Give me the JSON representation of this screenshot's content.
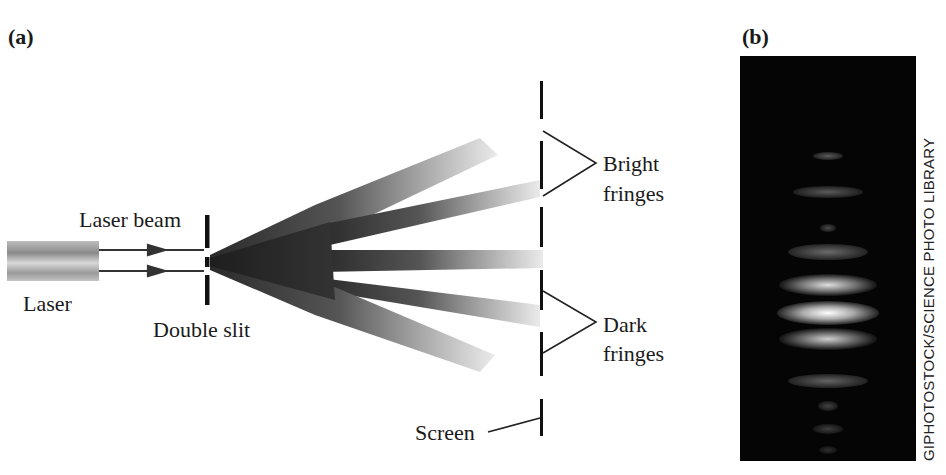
{
  "panels": {
    "a": {
      "label": "(a)"
    },
    "b": {
      "label": "(b)"
    }
  },
  "labels": {
    "laser": "Laser",
    "laser_beam": "Laser beam",
    "double_slit": "Double slit",
    "bright_fringes_1": "Bright",
    "bright_fringes_2": "fringes",
    "dark_fringes_1": "Dark",
    "dark_fringes_2": "fringes",
    "screen": "Screen"
  },
  "photo_credit": "GIPHOTOSTOCK/SCIENCE PHOTO LIBRARY",
  "colors": {
    "ink": "#1a1a1a",
    "beam_dark": "#2a2a2a",
    "photo_bg": "#050505"
  }
}
